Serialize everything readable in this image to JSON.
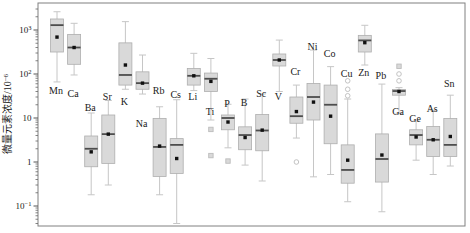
{
  "chart_data": {
    "type": "boxplot",
    "title": "",
    "ylabel": {
      "base": "微量元素浓度/10",
      "sup": "−6"
    },
    "yscale": "log",
    "ylim": [
      0.035,
      4000
    ],
    "grid": false,
    "yticks": [
      {
        "v": 1000,
        "base": "10",
        "sup": "3"
      },
      {
        "v": 100,
        "base": "10",
        "sup": "2"
      },
      {
        "v": 10,
        "base": "10",
        "sup": ""
      },
      {
        "v": 1,
        "base": "1",
        "sup": ""
      },
      {
        "v": 0.1,
        "base": "10",
        "sup": "−1"
      }
    ],
    "colors": {
      "box_fill": "#d9d9d9",
      "box_edge": "#aeaeae",
      "whisker": "#c6c6c6",
      "median": "#4d4d4d",
      "mean": "#111111",
      "outlier": "#bcbcbc",
      "frame": "#808080",
      "text": "#1a1a1a"
    },
    "elements": [
      {
        "name": "Mn",
        "whisker_low": 66,
        "q1": 316,
        "median": 1290,
        "q3": 1780,
        "whisker_high": 2600,
        "mean": 690,
        "outliers_circle": [],
        "outliers_square": [],
        "label_side": "below",
        "label_y": 90
      },
      {
        "name": "Ca",
        "whisker_low": 95,
        "q1": 166,
        "median": 400,
        "q3": 795,
        "whisker_high": 1420,
        "mean": 400,
        "outliers_circle": [],
        "outliers_square": [],
        "label_side": "below",
        "label_y": 93
      },
      {
        "name": "Ba",
        "whisker_low": 0.18,
        "q1": 0.78,
        "median": 2.0,
        "q3": 3.9,
        "whisker_high": 13,
        "mean": 1.7,
        "outliers_circle": [],
        "outliers_square": [],
        "label_side": "above",
        "label_y": 107
      },
      {
        "name": "Sr",
        "whisker_low": 0.3,
        "q1": 0.93,
        "median": 4.3,
        "q3": 11.7,
        "whisker_high": 25,
        "mean": 4.3,
        "outliers_circle": [],
        "outliers_square": [],
        "label_side": "above",
        "label_y": 96
      },
      {
        "name": "K",
        "whisker_low": 45,
        "q1": 56,
        "median": 95,
        "q3": 510,
        "whisker_high": 1550,
        "mean": 160,
        "outliers_circle": [],
        "outliers_square": [],
        "label_side": "below",
        "label_y": 101
      },
      {
        "name": "Na",
        "whisker_low": 35,
        "q1": 45,
        "median": 62,
        "q3": 112,
        "whisker_high": 270,
        "mean": 62,
        "outliers_circle": [],
        "outliers_square": [],
        "label_side": "below",
        "label_y": 123
      },
      {
        "name": "Rb",
        "whisker_low": 0.18,
        "q1": 0.47,
        "median": 2.2,
        "q3": 9.8,
        "whisker_high": 18,
        "mean": 2.3,
        "outliers_circle": [],
        "outliers_square": [],
        "label_side": "above",
        "label_y": 90
      },
      {
        "name": "Cs",
        "whisker_low": 0.04,
        "q1": 0.55,
        "median": 2.45,
        "q3": 3.4,
        "whisker_high": 26,
        "mean": 1.2,
        "outliers_circle": [],
        "outliers_square": [],
        "label_side": "above",
        "label_y": 94
      },
      {
        "name": "Li",
        "whisker_low": 42,
        "q1": 56,
        "median": 91,
        "q3": 134,
        "whisker_high": 295,
        "mean": 91,
        "outliers_circle": [],
        "outliers_square": [],
        "label_side": "below",
        "label_y": 96
      },
      {
        "name": "Ti",
        "whisker_low": 9,
        "q1": 40,
        "median": 78,
        "q3": 105,
        "whisker_high": 225,
        "mean": 68,
        "outliers_circle": [],
        "outliers_square": [
          5.5,
          1.4
        ],
        "label_side": "below",
        "label_y": 111
      },
      {
        "name": "P",
        "whisker_low": 2.1,
        "q1": 5.4,
        "median": 10,
        "q3": 11.7,
        "whisker_high": 20.5,
        "mean": 8.1,
        "outliers_circle": [],
        "outliers_square": [
          1.05
        ],
        "label_side": "above",
        "label_y": 103
      },
      {
        "name": "B",
        "whisker_low": 0.85,
        "q1": 1.9,
        "median": 4.1,
        "q3": 6.3,
        "whisker_high": 27,
        "mean": 3.6,
        "outliers_circle": [],
        "outliers_square": [],
        "label_side": "above",
        "label_y": 102
      },
      {
        "name": "Sc",
        "whisker_low": 0.37,
        "q1": 1.8,
        "median": 5.2,
        "q3": 12,
        "whisker_high": 35,
        "mean": 5.3,
        "outliers_circle": [],
        "outliers_square": [],
        "label_side": "above",
        "label_y": 93
      },
      {
        "name": "V",
        "whisker_low": 40,
        "q1": 152,
        "median": 208,
        "q3": 285,
        "whisker_high": 590,
        "mean": 208,
        "outliers_circle": [],
        "outliers_square": [],
        "label_side": "below",
        "label_y": 96
      },
      {
        "name": "Cr",
        "whisker_low": 3.5,
        "q1": 7.6,
        "median": 11,
        "q3": 30,
        "whisker_high": 56,
        "mean": 14,
        "outliers_circle": [
          1.0
        ],
        "outliers_square": [],
        "label_side": "above",
        "label_y": 71
      },
      {
        "name": "Ni",
        "whisker_low": 0.46,
        "q1": 9,
        "median": 30,
        "q3": 61,
        "whisker_high": 350,
        "mean": 23,
        "outliers_circle": [],
        "outliers_square": [],
        "label_side": "above",
        "label_y": 46
      },
      {
        "name": "Co",
        "whisker_low": 0.52,
        "q1": 2.6,
        "median": 20,
        "q3": 56,
        "whisker_high": 147,
        "mean": 11,
        "outliers_circle": [],
        "outliers_square": [],
        "label_side": "above",
        "label_y": 53
      },
      {
        "name": "Cu",
        "whisker_low": 0.125,
        "q1": 0.33,
        "median": 0.66,
        "q3": 2.45,
        "whisker_high": 27,
        "mean": 1.1,
        "outliers_circle": [
          70,
          45,
          32
        ],
        "outliers_square": [],
        "label_side": "above",
        "label_y": 73
      },
      {
        "name": "Zn",
        "whisker_low": 160,
        "q1": 316,
        "median": 580,
        "q3": 755,
        "whisker_high": 1280,
        "mean": 515,
        "outliers_circle": [],
        "outliers_square": [],
        "label_side": "below",
        "label_y": 72
      },
      {
        "name": "Pb",
        "whisker_low": 0.074,
        "q1": 0.35,
        "median": 1.17,
        "q3": 4.35,
        "whisker_high": 59,
        "mean": 1.44,
        "outliers_circle": [],
        "outliers_square": [],
        "label_side": "above",
        "label_y": 75
      },
      {
        "name": "Ga",
        "whisker_low": 12.8,
        "q1": 33,
        "median": 41,
        "q3": 44.5,
        "whisker_high": 49,
        "mean": 40,
        "outliers_circle": [
          100,
          70
        ],
        "outliers_square": [
          150
        ],
        "label_side": "below",
        "label_y": 111
      },
      {
        "name": "Ge",
        "whisker_low": 1.1,
        "q1": 2.45,
        "median": 4.1,
        "q3": 5.4,
        "whisker_high": 8.6,
        "mean": 3.7,
        "outliers_circle": [],
        "outliers_square": [],
        "label_side": "above",
        "label_y": 118
      },
      {
        "name": "As",
        "whisker_low": 0.52,
        "q1": 1.33,
        "median": 3.2,
        "q3": 6.4,
        "whisker_high": 15,
        "mean": 3.2,
        "outliers_circle": [],
        "outliers_square": [],
        "label_side": "above",
        "label_y": 108
      },
      {
        "name": "Sn",
        "whisker_low": 0.81,
        "q1": 1.33,
        "median": 2.45,
        "q3": 9.7,
        "whisker_high": 33,
        "mean": 3.8,
        "outliers_circle": [],
        "outliers_square": [],
        "label_side": "above",
        "label_y": 83
      }
    ]
  }
}
